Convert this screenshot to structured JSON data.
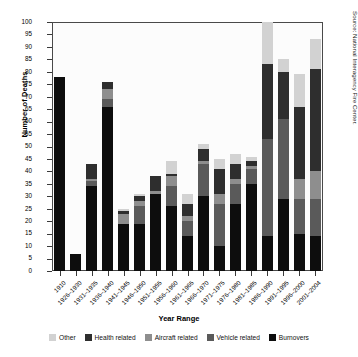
{
  "chart_data": {
    "type": "bar",
    "stacked": true,
    "title": "",
    "xlabel": "Year Range",
    "ylabel": "Number of Deaths",
    "ylim": [
      0,
      100
    ],
    "ytick_step": 5,
    "grid": false,
    "legend_position": "bottom",
    "source_note": "Source: National Interagency Fire Center.",
    "yticks": [
      0,
      5,
      10,
      15,
      20,
      25,
      30,
      35,
      40,
      45,
      50,
      55,
      60,
      65,
      70,
      75,
      80,
      85,
      90,
      95,
      100
    ],
    "categories": [
      "1910",
      "1926–1930",
      "1931–1935",
      "1936–1940",
      "1941–1945",
      "1946–1950",
      "1951–1955",
      "1956–1960",
      "1961–1965",
      "1966–1970",
      "1971–1975",
      "1976–1980",
      "1981–1985",
      "1986–1990",
      "1991–1995",
      "1996–2000",
      "2001–2004"
    ],
    "series": [
      {
        "name": "Burnovers",
        "color": "#0d0d0d",
        "values": [
          78,
          7,
          34,
          66,
          19,
          19,
          31,
          26,
          14,
          30,
          10,
          27,
          35,
          14,
          29,
          15,
          14
        ]
      },
      {
        "name": "Vehicle related",
        "color": "#5a5a5a",
        "values": [
          0,
          0,
          2,
          3,
          0,
          7,
          0,
          8,
          6,
          13,
          17,
          8,
          6,
          39,
          32,
          14,
          15
        ]
      },
      {
        "name": "Aircraft related",
        "color": "#8e8e8e",
        "values": [
          0,
          0,
          1,
          4,
          4,
          2,
          1,
          4,
          2,
          1,
          4,
          2,
          1,
          0,
          0,
          8,
          11
        ]
      },
      {
        "name": "Health related",
        "color": "#2e2e2e",
        "values": [
          0,
          0,
          6,
          3,
          1,
          2,
          6,
          1,
          5,
          5,
          10,
          6,
          2,
          30,
          19,
          29,
          41
        ]
      },
      {
        "name": "Other",
        "color": "#d2d2d2",
        "values": [
          0,
          0,
          0,
          0,
          1,
          1,
          0,
          5,
          4,
          2,
          4,
          4,
          2,
          17,
          5,
          13,
          12
        ]
      }
    ],
    "totals": [
      78,
      7,
      43,
      76,
      25,
      31,
      38,
      44,
      31,
      51,
      45,
      47,
      46,
      100,
      85,
      79,
      93
    ]
  },
  "legend": {
    "items": [
      {
        "label": "Other",
        "color": "#d2d2d2"
      },
      {
        "label": "Health related",
        "color": "#2e2e2e"
      },
      {
        "label": "Aircraft related",
        "color": "#8e8e8e"
      },
      {
        "label": "Vehicle related",
        "color": "#5a5a5a"
      },
      {
        "label": "Burnovers",
        "color": "#0d0d0d"
      }
    ]
  },
  "axes": {
    "y_title": "Number of Deaths",
    "x_title": "Year Range"
  },
  "notes": {
    "source": "Source: National Interagency Fire Center."
  }
}
